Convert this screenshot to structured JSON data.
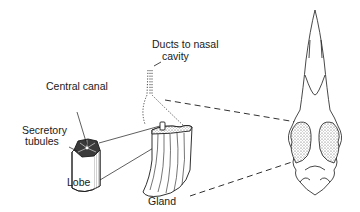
{
  "diagram": {
    "labels": {
      "ducts_line1": "Ducts to nasal",
      "ducts_line2": "cavity",
      "central_canal": "Central canal",
      "secretory_line1": "Secretory",
      "secretory_line2": "tubules",
      "lobe": "Lobe",
      "gland": "Gland"
    },
    "parts": [
      "lobe",
      "gland",
      "ducts",
      "skull"
    ],
    "colors": {
      "ink": "#1a1a1a",
      "background": "#ffffff",
      "stipple": "#555555"
    }
  }
}
